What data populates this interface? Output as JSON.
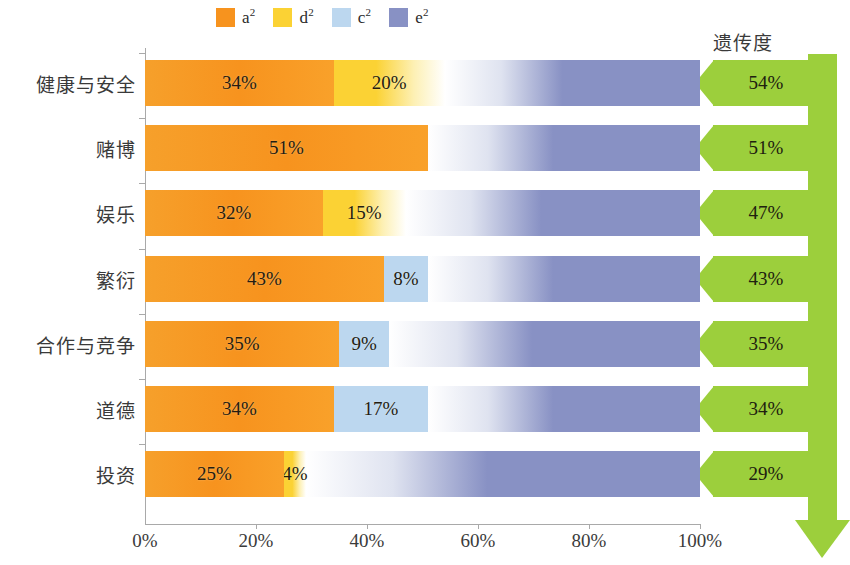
{
  "legend": {
    "items": [
      {
        "key": "a2",
        "label": "a",
        "sup": "2",
        "color": "#f7931e",
        "name": "additive-genetic"
      },
      {
        "key": "d2",
        "label": "d",
        "sup": "2",
        "color": "#fbd234",
        "name": "dominance-genetic"
      },
      {
        "key": "c2",
        "label": "c",
        "sup": "2",
        "color": "#bcd7ef",
        "name": "shared-environment"
      },
      {
        "key": "e2",
        "label": "e",
        "sup": "2",
        "color": "#8891c4",
        "name": "nonshared-environment"
      }
    ]
  },
  "heritability_header": "遗传度",
  "axis": {
    "x_ticks": [
      "0%",
      "20%",
      "40%",
      "60%",
      "80%",
      "100%"
    ],
    "x_tick_values": [
      0,
      20,
      40,
      60,
      80,
      100
    ]
  },
  "chart_data": {
    "type": "bar",
    "title": "",
    "subtitle": "",
    "xlabel": "",
    "ylabel": "",
    "xlim": [
      0,
      100
    ],
    "grid": false,
    "legend_position": "top",
    "orientation": "horizontal",
    "stacked": true,
    "categories": [
      "健康与安全",
      "赌博",
      "娱乐",
      "繁衍",
      "合作与竞争",
      "道德",
      "投资"
    ],
    "series": [
      {
        "name": "a²",
        "color": "#f7931e",
        "values": [
          34,
          51,
          32,
          43,
          35,
          34,
          25
        ]
      },
      {
        "name": "d²",
        "color": "#fbd234",
        "values": [
          20,
          0,
          15,
          0,
          0,
          0,
          4
        ]
      },
      {
        "name": "c²",
        "color": "#bcd7ef",
        "values": [
          0,
          0,
          0,
          8,
          9,
          17,
          0
        ]
      },
      {
        "name": "e²",
        "color": "#8891c4",
        "values": [
          46,
          49,
          53,
          49,
          56,
          49,
          71
        ]
      }
    ],
    "annotations": {
      "heritability_label": "遗传度",
      "heritability_values": [
        "54%",
        "51%",
        "47%",
        "43%",
        "35%",
        "34%",
        "29%"
      ]
    },
    "rows": [
      {
        "category": "健康与安全",
        "heritability": "54%",
        "segments": [
          {
            "key": "a2",
            "value": 34,
            "label": "34%",
            "show_label": true
          },
          {
            "key": "d2",
            "value": 20,
            "label": "20%",
            "show_label": true
          },
          {
            "key": "e2",
            "value": 46,
            "label": "46%",
            "show_label": false
          }
        ]
      },
      {
        "category": "赌博",
        "heritability": "51%",
        "segments": [
          {
            "key": "a2",
            "value": 51,
            "label": "51%",
            "show_label": true
          },
          {
            "key": "e2",
            "value": 49,
            "label": "49%",
            "show_label": false
          }
        ]
      },
      {
        "category": "娱乐",
        "heritability": "47%",
        "segments": [
          {
            "key": "a2",
            "value": 32,
            "label": "32%",
            "show_label": true
          },
          {
            "key": "d2",
            "value": 15,
            "label": "15%",
            "show_label": true
          },
          {
            "key": "e2",
            "value": 53,
            "label": "53%",
            "show_label": false
          }
        ]
      },
      {
        "category": "繁衍",
        "heritability": "43%",
        "segments": [
          {
            "key": "a2",
            "value": 43,
            "label": "43%",
            "show_label": true
          },
          {
            "key": "c2",
            "value": 8,
            "label": "8%",
            "show_label": true
          },
          {
            "key": "e2",
            "value": 49,
            "label": "49%",
            "show_label": false
          }
        ]
      },
      {
        "category": "合作与竞争",
        "heritability": "35%",
        "segments": [
          {
            "key": "a2",
            "value": 35,
            "label": "35%",
            "show_label": true
          },
          {
            "key": "c2",
            "value": 9,
            "label": "9%",
            "show_label": true
          },
          {
            "key": "e2",
            "value": 56,
            "label": "56%",
            "show_label": false
          }
        ]
      },
      {
        "category": "道德",
        "heritability": "34%",
        "segments": [
          {
            "key": "a2",
            "value": 34,
            "label": "34%",
            "show_label": true
          },
          {
            "key": "c2",
            "value": 17,
            "label": "17%",
            "show_label": true
          },
          {
            "key": "e2",
            "value": 49,
            "label": "49%",
            "show_label": false
          }
        ]
      },
      {
        "category": "投资",
        "heritability": "29%",
        "segments": [
          {
            "key": "a2",
            "value": 25,
            "label": "25%",
            "show_label": true
          },
          {
            "key": "d2",
            "value": 4,
            "label": "4%",
            "show_label": true
          },
          {
            "key": "e2",
            "value": 71,
            "label": "71%",
            "show_label": false
          }
        ]
      }
    ]
  }
}
